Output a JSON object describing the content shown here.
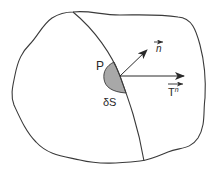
{
  "diagram": {
    "type": "stress-vector-diagram",
    "labels": {
      "point": "P",
      "area": "δS",
      "normal": "n",
      "traction": "T",
      "traction_superscript": "n"
    },
    "colors": {
      "outline": "#3a3a3a",
      "shaded_area": "#a8a8a8",
      "background": "#ffffff"
    },
    "elements": [
      {
        "name": "body-outline",
        "shape": "irregular-closed-curve"
      },
      {
        "name": "cutting-surface",
        "shape": "curve"
      },
      {
        "name": "surface-element",
        "shape": "half-disk"
      },
      {
        "name": "normal-vector",
        "shape": "arrow"
      },
      {
        "name": "traction-vector",
        "shape": "arrow"
      }
    ]
  }
}
